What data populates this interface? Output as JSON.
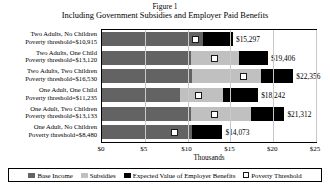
{
  "figure": {
    "label": "Figure 1",
    "title": "Including Government Subsidies and Employer Paid Benefits"
  },
  "axis": {
    "xtitle": "Thousands",
    "ticks": [
      "$0",
      "$5",
      "$10",
      "$15",
      "$20",
      "$25"
    ]
  },
  "legend": {
    "items": [
      {
        "label": "Base Income",
        "color": "#636363"
      },
      {
        "label": "Subsidies",
        "color": "#c0c0c0"
      },
      {
        "label": "Expected Value of Employer Benefits",
        "color": "#000000"
      },
      {
        "label": "Poverty Threshold",
        "color": "#ffffff"
      }
    ]
  },
  "rows": [
    {
      "category": "Two Adults, No Children",
      "threshold_label": "Poverty threshold=$10,915",
      "total_label": "$15,297"
    },
    {
      "category": "Two Adults, One Child",
      "threshold_label": "Poverty threshold=$13,120",
      "total_label": "$19,406"
    },
    {
      "category": "Two Adults, Two Children",
      "threshold_label": "Poverty threshold=$16,530",
      "total_label": "$22,356"
    },
    {
      "category": "One Adult, One Child",
      "threshold_label": "Poverty threshold=$11,235",
      "total_label": "$18,242"
    },
    {
      "category": "One Adult, Two Children",
      "threshold_label": "Poverty threshold=$13,133",
      "total_label": "$21,312"
    },
    {
      "category": "One Adult, No Children",
      "threshold_label": "Poverty threshold=$8,480",
      "total_label": "$14,073"
    }
  ],
  "chart_data": {
    "type": "bar",
    "orientation": "horizontal",
    "stacked": true,
    "title": "Including Government Subsidies and Employer Paid Benefits",
    "xlabel": "Thousands",
    "ylabel": "",
    "xlim": [
      0,
      25000
    ],
    "xticks": [
      0,
      5000,
      10000,
      15000,
      20000,
      25000
    ],
    "xticklabels": [
      "$0",
      "$5",
      "$10",
      "$15",
      "$20",
      "$25"
    ],
    "grid": true,
    "legend_position": "bottom",
    "categories": [
      "Two Adults, No Children",
      "Two Adults, One Child",
      "Two Adults, Two Children",
      "One Adult, One Child",
      "One Adult, Two Children",
      "One Adult, No Children"
    ],
    "series": [
      {
        "name": "Base Income",
        "values": [
          11800,
          10400,
          10500,
          9100,
          10400,
          10500
        ]
      },
      {
        "name": "Subsidies",
        "values": [
          0,
          5600,
          8100,
          5000,
          7000,
          0
        ]
      },
      {
        "name": "Expected Value of Employer Benefits",
        "values": [
          3497,
          3406,
          3756,
          4142,
          3912,
          3573
        ]
      }
    ],
    "totals": [
      15297,
      19406,
      22356,
      18242,
      21312,
      14073
    ],
    "total_labels": [
      "$15,297",
      "$19,406",
      "$22,356",
      "$18,242",
      "$21,312",
      "$14,073"
    ],
    "markers": {
      "name": "Poverty Threshold",
      "values": [
        10915,
        13120,
        16530,
        11235,
        13133,
        8480
      ],
      "labels": [
        "Poverty threshold=$10,915",
        "Poverty threshold=$13,120",
        "Poverty threshold=$16,530",
        "Poverty threshold=$11,235",
        "Poverty threshold=$13,133",
        "Poverty threshold=$8,480"
      ]
    }
  }
}
